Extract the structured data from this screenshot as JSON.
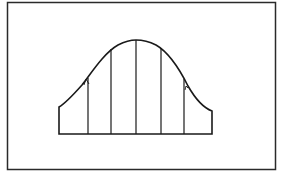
{
  "figure": {
    "stroke_color": "#1a1a1a",
    "background_color": "#ffffff",
    "frame": {
      "x": 7,
      "y": 2,
      "width": 269,
      "height": 168
    },
    "curve": {
      "baseline_y": 134,
      "left_x": 59,
      "right_x": 212,
      "left_top_y": 107,
      "right_top_y": 111,
      "peak": {
        "x": 136,
        "y": 40
      }
    },
    "dividers_x": [
      88,
      111,
      136,
      161,
      184
    ],
    "inflection_marks": [
      {
        "side": "left",
        "x": 86,
        "y": 82
      },
      {
        "side": "right",
        "x": 186,
        "y": 88
      }
    ]
  }
}
